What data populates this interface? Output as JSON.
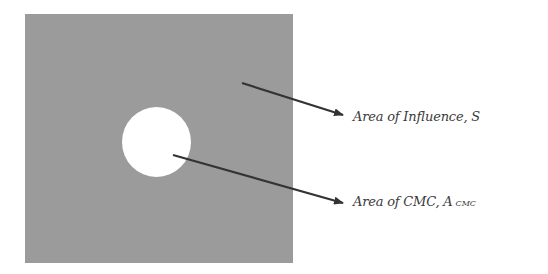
{
  "diagram": {
    "regions": {
      "area_of_influence": {
        "shape": "square",
        "color": "#9b9b9b"
      },
      "cmc": {
        "shape": "circle",
        "color": "#ffffff"
      }
    },
    "labels": {
      "influence": {
        "text": "Area of Influence, S"
      },
      "cmc": {
        "text": "Area of CMC, A",
        "subscript": "CMC"
      }
    },
    "arrows": [
      {
        "from_label": "influence",
        "to_region": "area_of_influence",
        "color": "#333333"
      },
      {
        "from_label": "cmc",
        "to_region": "cmc",
        "color": "#333333"
      }
    ]
  }
}
